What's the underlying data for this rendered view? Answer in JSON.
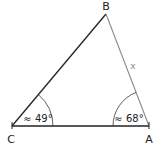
{
  "diagram": {
    "type": "triangle",
    "vertices": {
      "A": {
        "label": "A"
      },
      "B": {
        "label": "B"
      },
      "C": {
        "label": "C"
      }
    },
    "sides": {
      "AB": {
        "label": "x",
        "color": "#8a8a8a"
      },
      "BC": {
        "color": "#222222"
      },
      "CA": {
        "color": "#222222"
      }
    },
    "angles": {
      "C": {
        "label": "≈ 49°"
      },
      "A": {
        "label": "≈ 68°"
      }
    }
  }
}
